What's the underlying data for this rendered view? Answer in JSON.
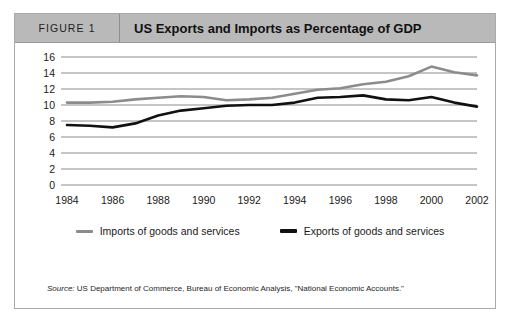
{
  "figure": {
    "number_label": "FIGURE 1",
    "title": "US Exports and Imports as Percentage of GDP"
  },
  "source": {
    "label": "Source:",
    "text": " US Department of Commerce, Bureau of Economic Analysis, \"National Economic Accounts.\""
  },
  "legend": {
    "position": "bottom",
    "items": [
      {
        "label": "Imports of goods and services",
        "color": "#8c8c8c"
      },
      {
        "label": "Exports of goods and services",
        "color": "#111111"
      }
    ]
  },
  "chart_data": {
    "type": "line",
    "title": "US Exports and Imports as Percentage of GDP",
    "xlabel": "",
    "ylabel": "",
    "ylim": [
      0,
      16
    ],
    "ytick_step": 2,
    "yticks": [
      0,
      2,
      4,
      6,
      8,
      10,
      12,
      14,
      16
    ],
    "grid": true,
    "xlim": [
      1984,
      2002
    ],
    "xticks": [
      1984,
      1986,
      1988,
      1990,
      1992,
      1994,
      1996,
      1998,
      2000,
      2002
    ],
    "x": [
      1984,
      1985,
      1986,
      1987,
      1988,
      1989,
      1990,
      1991,
      1992,
      1993,
      1994,
      1995,
      1996,
      1997,
      1998,
      1999,
      2000,
      2001,
      2002
    ],
    "series": [
      {
        "name": "Imports of goods and services",
        "color": "#8c8c8c",
        "width": 2.6,
        "values": [
          10.3,
          10.3,
          10.4,
          10.7,
          10.9,
          11.1,
          11.0,
          10.6,
          10.7,
          10.9,
          11.4,
          11.9,
          12.1,
          12.6,
          12.9,
          13.6,
          14.8,
          14.1,
          13.7
        ]
      },
      {
        "name": "Exports of goods and services",
        "color": "#111111",
        "width": 2.6,
        "values": [
          7.5,
          7.4,
          7.2,
          7.7,
          8.7,
          9.3,
          9.6,
          9.9,
          10.0,
          10.0,
          10.3,
          10.9,
          11.0,
          11.2,
          10.7,
          10.6,
          11.0,
          10.3,
          9.8
        ]
      }
    ]
  }
}
